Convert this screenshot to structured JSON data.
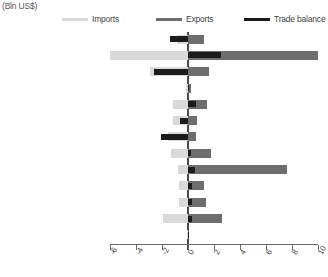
{
  "units_label": "(Bln US$)",
  "legend": {
    "items": [
      {
        "name": "imports",
        "label": "Imports",
        "color": "#d9d9d9",
        "thickness": 3
      },
      {
        "name": "exports",
        "label": "Exports",
        "color": "#6e6e6e",
        "thickness": 3
      },
      {
        "name": "trade-balance",
        "label": "Trade balance",
        "color": "#1c1c1c",
        "thickness": 3
      }
    ]
  },
  "colors": {
    "imports": "#d9d9d9",
    "exports": "#6e6e6e",
    "balance": "#1c1c1c",
    "axis": "#6a6a6a",
    "zero_line": "#4a4a4a"
  },
  "chart_data": {
    "type": "bar",
    "orientation": "horizontal",
    "title": "",
    "subtitle": "",
    "xlabel": "",
    "ylabel": "",
    "units": "(Bln US$)",
    "xlim": [
      -6,
      10
    ],
    "xticks": [
      -6,
      -4,
      -2,
      0,
      2,
      4,
      6,
      8,
      10
    ],
    "xtick_labels": [
      "-6",
      "-4",
      "-2",
      "0",
      "2",
      "4",
      "6",
      "8",
      "10"
    ],
    "grid": false,
    "legend_position": "top",
    "categories": [
      "Developed Asia-Pacific",
      "Developed Europe",
      "Developed N. America",
      "South-eastern Europe",
      "C I S",
      "Northern Africa",
      "Sub-Saharan Africa",
      "Latin Am, Caribbean",
      "Eastern Asia",
      "Southern Asia",
      "South-eastern Asia",
      "Western Asia",
      "Oceania"
    ],
    "series": [
      {
        "name": "Imports",
        "color": "#d9d9d9",
        "values": [
          -0.85,
          -6.0,
          -2.95,
          -0.15,
          -1.15,
          -1.15,
          -1.55,
          -1.3,
          -0.75,
          -0.7,
          -0.7,
          -1.9,
          -0.05
        ]
      },
      {
        "name": "Exports",
        "color": "#6e6e6e",
        "values": [
          1.25,
          10.0,
          1.6,
          0.2,
          1.45,
          0.7,
          0.6,
          1.75,
          7.6,
          1.25,
          1.35,
          2.6,
          0.05
        ]
      },
      {
        "name": "Trade balance",
        "color": "#1c1c1c",
        "values": [
          -1.4,
          2.5,
          -2.6,
          0.1,
          0.6,
          -0.6,
          -2.05,
          0.2,
          0.55,
          0.3,
          0.3,
          0.3,
          0.02
        ]
      }
    ]
  }
}
